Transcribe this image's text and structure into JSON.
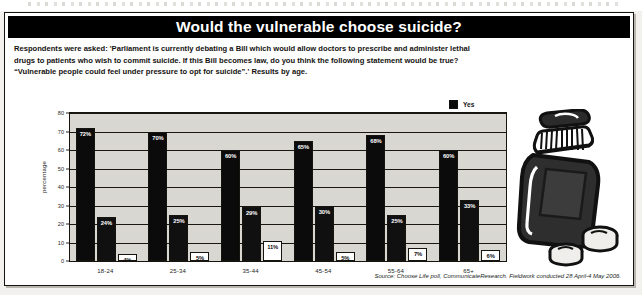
{
  "title": "Would the vulnerable choose suicide?",
  "intro_lines": [
    "Respondents were asked: 'Parliament is currently debating a Bill which would allow doctors to prescribe and administer lethal",
    "drugs to patients who wish to commit suicide. If this Bill becomes law, do you think the following statement would be true?",
    "“Vulnerable people could feel under pressure to opt for suicide”.' Results by age."
  ],
  "source": "Source: Choose Life poll, CommunicateResearch. Fieldwork conducted 28 April-4 May 2006.",
  "illustration": {
    "name": "pill-bottle-illustration",
    "description": "medicine bottle with two loose pills"
  },
  "colors": {
    "title_bar": "#000000",
    "title_text": "#ffffff",
    "plot_background": "#d9d7d2",
    "bar_yes": "#0b0b0b",
    "bar_no": "#101010",
    "bar_dont_know": "#ffffff",
    "axis": "#16140f"
  },
  "chart_data": {
    "type": "bar",
    "title": "Would the vulnerable choose suicide?",
    "xlabel": "",
    "ylabel": "percentage",
    "ylim": [
      0,
      80
    ],
    "yticks": [
      0,
      10,
      20,
      30,
      40,
      50,
      60,
      70,
      80
    ],
    "grid": true,
    "legend_position": "top-right",
    "categories": [
      "18-24",
      "25-34",
      "35-44",
      "45-54",
      "55-64",
      "65+"
    ],
    "series": [
      {
        "name": "Yes",
        "values": [
          72,
          70,
          60,
          65,
          68,
          60
        ],
        "labels": [
          "72%",
          "70%",
          "60%",
          "65%",
          "68%",
          "60%"
        ]
      },
      {
        "name": "No",
        "values": [
          24,
          25,
          29,
          30,
          25,
          33
        ],
        "labels": [
          "24%",
          "25%",
          "29%",
          "30%",
          "25%",
          "33%"
        ]
      },
      {
        "name": "Don't know",
        "values": [
          4,
          5,
          11,
          5,
          7,
          6
        ],
        "labels": [
          "4%",
          "5%",
          "11%",
          "5%",
          "7%",
          "6%"
        ]
      }
    ]
  }
}
